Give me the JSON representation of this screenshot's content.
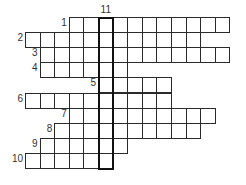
{
  "puzzle": {
    "type": "crossword",
    "cell_size": {
      "w": 14.6,
      "h": 15.1
    },
    "origin": {
      "x": 25,
      "y": 17
    },
    "rows": [
      {
        "number": "1",
        "row": 0,
        "start_col": 3,
        "end_col": 13
      },
      {
        "number": "2",
        "row": 1,
        "start_col": 0,
        "end_col": 11
      },
      {
        "number": "3",
        "row": 2,
        "start_col": 1,
        "end_col": 13
      },
      {
        "number": "4",
        "row": 3,
        "start_col": 1,
        "end_col": 6
      },
      {
        "number": "5",
        "row": 4,
        "start_col": 5,
        "end_col": 9
      },
      {
        "number": "6",
        "row": 5,
        "start_col": 0,
        "end_col": 9
      },
      {
        "number": "7",
        "row": 6,
        "start_col": 3,
        "end_col": 12
      },
      {
        "number": "8",
        "row": 7,
        "start_col": 2,
        "end_col": 11
      },
      {
        "number": "9",
        "row": 8,
        "start_col": 1,
        "end_col": 6
      },
      {
        "number": "10",
        "row": 9,
        "start_col": 0,
        "end_col": 5
      }
    ],
    "vertical_word": {
      "number": "11",
      "col": 5,
      "start_row": 0,
      "end_row": 9
    },
    "colors": {
      "border": "#2a2a2a",
      "highlight_border": "#111111",
      "text": "#333333"
    }
  }
}
